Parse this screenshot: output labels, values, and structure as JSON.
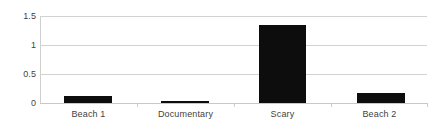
{
  "chart_data": {
    "type": "bar",
    "title": "",
    "xlabel": "",
    "ylabel": "",
    "categories": [
      "Beach 1",
      "Documentary",
      "Scary",
      "Beach 2"
    ],
    "values": [
      0.12,
      0.02,
      1.34,
      0.18
    ],
    "ylim": [
      0,
      1.5
    ],
    "yticks": [
      0,
      0.5,
      1,
      1.5
    ],
    "ytick_labels": [
      "0",
      "0.5",
      "1",
      "1.5"
    ],
    "grid": true,
    "grid_axis": "y",
    "legend": false,
    "legend_position": "none",
    "bar_color": "#0d0d0d",
    "gridline_color": "#d2d2d2",
    "text_color": "#3f3f3f",
    "background_color": "#ffffff"
  },
  "axes": {
    "y_tick_labels": [
      {
        "text": "1.5",
        "value": 1.5
      },
      {
        "text": "1",
        "value": 1
      },
      {
        "text": "0.5",
        "value": 0.5
      },
      {
        "text": "0",
        "value": 0
      }
    ],
    "x_tick_labels": [
      {
        "text": "Beach 1"
      },
      {
        "text": "Documentary"
      },
      {
        "text": "Scary"
      },
      {
        "text": "Beach 2"
      }
    ]
  },
  "bars": [
    {
      "label": "Beach 1",
      "value": 0.12
    },
    {
      "label": "Documentary",
      "value": 0.02
    },
    {
      "label": "Scary",
      "value": 1.34
    },
    {
      "label": "Beach 2",
      "value": 0.18
    }
  ]
}
